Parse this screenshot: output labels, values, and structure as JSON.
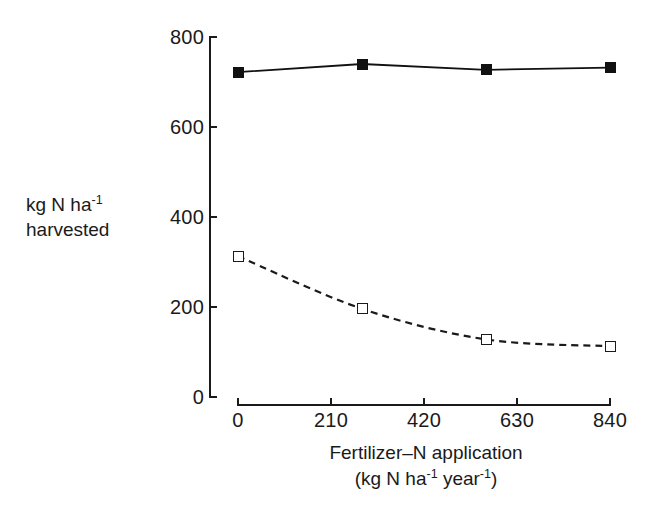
{
  "chart_data": {
    "type": "line",
    "title": "",
    "subtitle": "",
    "xlabel_line1": "Fertilizer–N application",
    "xlabel_line2_pre": "(kg N ha",
    "xlabel_line2_sup1": "-1",
    "xlabel_line2_mid": " year",
    "xlabel_line2_sup2": "-1",
    "xlabel_line2_post": ")",
    "ylabel_line1_pre": "kg N ha",
    "ylabel_line1_sup": "-1",
    "ylabel_line2": "harvested",
    "xlim": [
      0,
      840
    ],
    "ylim": [
      0,
      800
    ],
    "xticks": [
      0,
      210,
      420,
      630,
      840
    ],
    "xtick_labels": [
      "0",
      "210",
      "420",
      "630",
      "840"
    ],
    "yticks": [
      0,
      200,
      400,
      600,
      800
    ],
    "ytick_labels": [
      "0",
      "200",
      "400",
      "600",
      "800"
    ],
    "grid": false,
    "legend": "none",
    "series": [
      {
        "name": "filled-square-series",
        "marker": "filled-square",
        "linestyle": "solid",
        "color": "#111111",
        "x": [
          0,
          280,
          560,
          840
        ],
        "values": [
          722,
          740,
          727,
          732
        ]
      },
      {
        "name": "open-square-series",
        "marker": "open-square",
        "linestyle": "dashed",
        "color": "#1a1a1a",
        "x": [
          0,
          280,
          560,
          840
        ],
        "values": [
          313,
          196,
          128,
          113
        ]
      }
    ]
  }
}
